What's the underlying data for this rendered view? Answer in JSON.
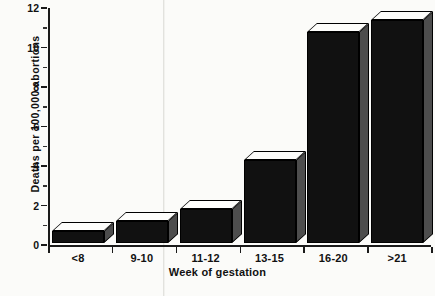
{
  "chart_data": {
    "type": "bar",
    "title": "",
    "xlabel": "Week of gestation",
    "ylabel": "Deaths per 100,000 abortions",
    "categories": [
      "<8",
      "9-10",
      "11-12",
      "13-15",
      "16-20",
      ">21"
    ],
    "values": [
      0.6,
      1.1,
      1.7,
      4.2,
      10.7,
      11.3
    ],
    "ylim": [
      0,
      12
    ],
    "ytick_labels": [
      "0",
      "2",
      "4",
      "6",
      "8",
      "10",
      "12"
    ],
    "ytick_values": [
      0,
      2,
      4,
      6,
      8,
      10,
      12
    ],
    "yminor_values": [
      1,
      3,
      5,
      7,
      9,
      11
    ],
    "grid": false,
    "legend": null,
    "style": "3d-bar",
    "colors": {
      "bar_front": "#111111",
      "bar_top": "#fdfdfb",
      "bar_side": "#4d4d4d",
      "axis": "#1a1a1a",
      "background": "#fbfbf9",
      "text": "#111111"
    }
  }
}
